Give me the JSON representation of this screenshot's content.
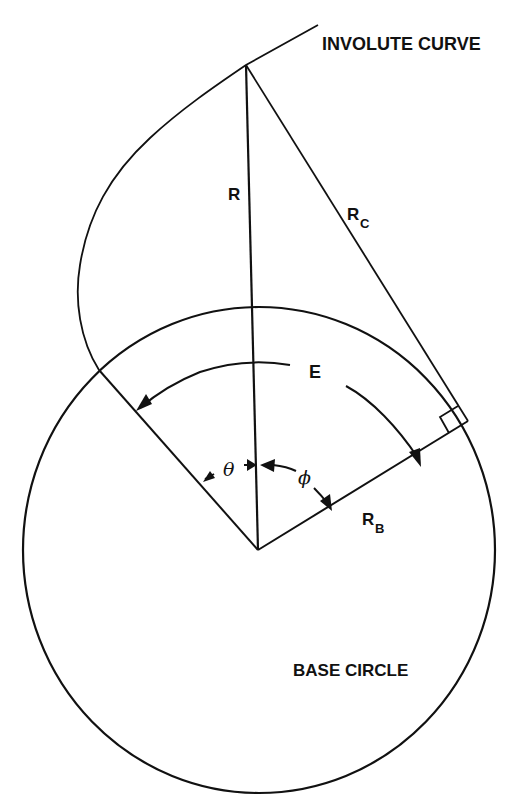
{
  "diagram": {
    "labels": {
      "involute_curve": "INVOLUTE CURVE",
      "base_circle": "BASE CIRCLE",
      "radius": "R",
      "curvature_radius_main": "R",
      "curvature_radius_sub": "C",
      "base_radius_main": "R",
      "base_radius_sub": "B",
      "arc_E": "E",
      "theta": "θ",
      "phi": "ϕ"
    },
    "colors": {
      "ink": "#111111",
      "background": "#ffffff"
    },
    "geometry": {
      "base_circle": {
        "cx": 259,
        "cy": 550,
        "rx": 236,
        "ry": 243
      },
      "center": [
        258,
        550
      ],
      "involute_start": [
        99,
        370
      ],
      "point_on_involute": [
        246,
        65
      ],
      "involute_end": [
        318,
        25
      ],
      "tangent_point": [
        468,
        421
      ]
    }
  }
}
